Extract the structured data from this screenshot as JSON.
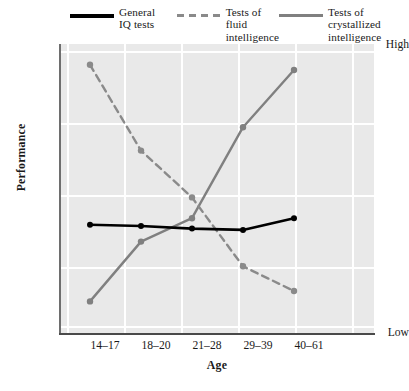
{
  "chart_data": {
    "type": "line",
    "title": "",
    "xlabel": "Age",
    "ylabel": "Performance",
    "categories": [
      "14-17",
      "18-20",
      "21-28",
      "29-39",
      "40-61"
    ],
    "ylim": [
      0,
      100
    ],
    "ytick_labels": [
      "High",
      "Low"
    ],
    "ytick_values": [
      100,
      0
    ],
    "grid": true,
    "grid_color": "#ffffff",
    "plot_background": "#e9e9e9",
    "legend_position": "top",
    "series": [
      {
        "name": "General IQ tests",
        "label_lines": "General\nIQ tests",
        "style": "solid",
        "color": "#000000",
        "marker": "circle",
        "values": [
          35.5,
          35.0,
          34.0,
          33.5,
          38.0
        ]
      },
      {
        "name": "Tests of fluid intelligence",
        "label_lines": "Tests of fluid\nintelligence",
        "style": "dashed",
        "color": "#8a8a8a",
        "marker": "circle",
        "values": [
          97.0,
          64.0,
          46.0,
          19.5,
          10.0
        ]
      },
      {
        "name": "Tests of crystallized intelligence",
        "label_lines": "Tests of crystallized\nintelligence",
        "style": "solid",
        "color": "#808080",
        "marker": "circle",
        "values": [
          6.0,
          29.0,
          38.0,
          73.0,
          95.0
        ]
      }
    ]
  },
  "legend": {
    "entries": [
      {
        "label": "General\nIQ tests",
        "swatch": "solid-black"
      },
      {
        "label": "Tests of fluid\nintelligence",
        "swatch": "dashed-gray"
      },
      {
        "label": "Tests of crystallized\nintelligence",
        "swatch": "solid-gray"
      }
    ]
  },
  "axes": {
    "y_title": "Performance",
    "x_title": "Age",
    "y_high": "High",
    "y_low": "Low",
    "x_ticks": [
      "14-17",
      "18-20",
      "21-28",
      "29-39",
      "40-61"
    ]
  }
}
